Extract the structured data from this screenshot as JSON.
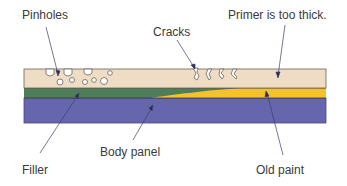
{
  "diagram": {
    "labels": {
      "pinholes": "Pinholes",
      "cracks": "Cracks",
      "primer_too_thick": "Primer is too thick.",
      "filler": "Filler",
      "body_panel": "Body panel",
      "old_paint": "Old paint"
    },
    "layers": [
      {
        "name": "primer",
        "color": "#EEDDC4"
      },
      {
        "name": "filler",
        "color": "#4E7D5A"
      },
      {
        "name": "old-paint",
        "color": "#F3C22C"
      },
      {
        "name": "body-panel",
        "color": "#6566AE"
      }
    ],
    "outline_color": "#6b6258",
    "leader_color": "#3a3d6a"
  }
}
